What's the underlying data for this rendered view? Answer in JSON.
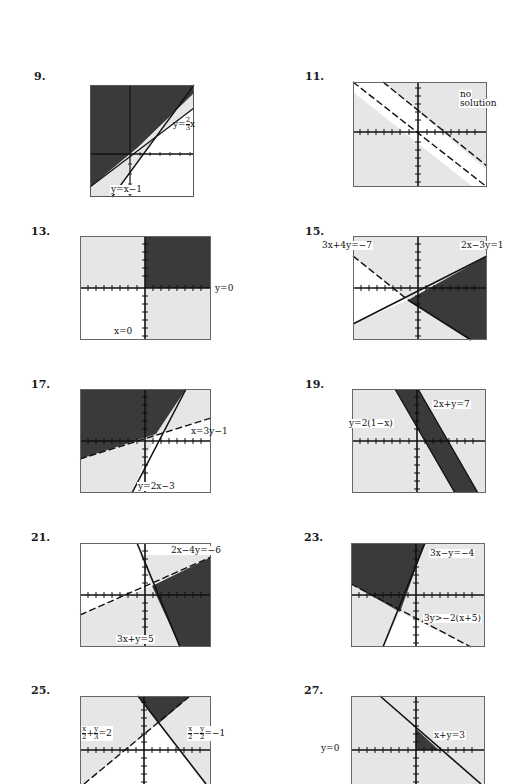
{
  "page": {
    "type": "textbook answer key — graphs of systems of linear inequalities"
  },
  "problems": [
    {
      "number": "9.",
      "labels": [
        "y=x−1",
        "y=2/3 x"
      ]
    },
    {
      "number": "11.",
      "labels": [
        "no",
        "solution"
      ]
    },
    {
      "number": "13.",
      "labels": [
        "y=0",
        "x=0"
      ]
    },
    {
      "number": "15.",
      "labels": [
        "3x+4y=−7",
        "2x−3y=1"
      ]
    },
    {
      "number": "17.",
      "labels": [
        "x=3y−1",
        "y=2x−3"
      ]
    },
    {
      "number": "19.",
      "labels": [
        "2x+y=7",
        "y=2(1−x)"
      ]
    },
    {
      "number": "21.",
      "labels": [
        "2x−4y=−6",
        "3x+y=5"
      ]
    },
    {
      "number": "23.",
      "labels": [
        "3x−y=−4",
        "3y>−2(x+5)"
      ]
    },
    {
      "number": "25.",
      "labels": [
        "x/2+y/3=2",
        "x/2−y/2=−1"
      ]
    },
    {
      "number": "27.",
      "labels": [
        "y=0",
        "x+y=3"
      ]
    }
  ],
  "text": {
    "p9_a": "y=x−1",
    "p9_b_pre": "y=",
    "p9_b_num": "2",
    "p9_b_den": "3",
    "p9_b_post": "x",
    "p11_a": "no",
    "p11_b": "solution",
    "p13_a": "y=0",
    "p13_b": "x=0",
    "p15_a": "3x+4y=−7",
    "p15_b": "2x−3y=1",
    "p17_a": "x=3y−1",
    "p17_b": "y=2x−3",
    "p19_a": "2x+y=7",
    "p19_b": "y=2(1−x)",
    "p21_a": "2x−4y=−6",
    "p21_b": "3x+y=5",
    "p23_a": "3x−y=−4",
    "p23_b": "3y>−2(x+5)",
    "p25_a_n1": "x",
    "p25_a_d1": "2",
    "p25_a_op": "+",
    "p25_a_n2": "y",
    "p25_a_d2": "3",
    "p25_a_rhs": "=2",
    "p25_b_n1": "x",
    "p25_b_d1": "2",
    "p25_b_op": "−",
    "p25_b_n2": "y",
    "p25_b_d2": "2",
    "p25_b_rhs": "=−1",
    "p27_a": "y=0",
    "p27_b": "x+y=3"
  },
  "colors": {
    "dark_region": "#3a3a3a",
    "light_region": "#e4e4e4",
    "white_region": "#ffffff",
    "line": "#111111",
    "frame": "#555555"
  }
}
